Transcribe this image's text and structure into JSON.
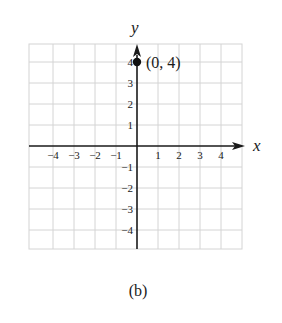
{
  "figure": {
    "caption": "(b)"
  },
  "chart_data": {
    "type": "scatter",
    "title": "",
    "xlabel": "x",
    "ylabel": "y",
    "xlim": [
      -5,
      5
    ],
    "ylim": [
      -5,
      5
    ],
    "xticks": [
      -4,
      -3,
      -2,
      -1,
      1,
      2,
      3,
      4
    ],
    "yticks": [
      -4,
      -3,
      -2,
      -1,
      1,
      2,
      3,
      4
    ],
    "xtick_labels": [
      "−4",
      "−3",
      "−2",
      "−1",
      "1",
      "2",
      "3",
      "4"
    ],
    "ytick_labels": [
      "−4",
      "−3",
      "−2",
      "−1",
      "1",
      "2",
      "3",
      "4"
    ],
    "grid": true,
    "points": [
      {
        "x": 0,
        "y": 4,
        "label": "(0, 4)"
      }
    ],
    "axis_arrows": {
      "x_positive": true,
      "y_positive": true
    }
  },
  "colors": {
    "grid": "#d4d4d4",
    "axis": "#1a1a1a",
    "point": "#111111"
  }
}
